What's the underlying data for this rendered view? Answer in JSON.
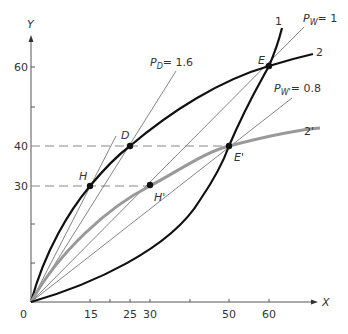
{
  "diagram": {
    "axes": {
      "x_label": "X",
      "y_label": "Y",
      "origin_label": "0",
      "x_ticks": [
        {
          "value": 15,
          "label": "15"
        },
        {
          "value": 20,
          "label": ""
        },
        {
          "value": 25,
          "label": "25"
        },
        {
          "value": 30,
          "label": "30"
        },
        {
          "value": 40,
          "label": ""
        },
        {
          "value": 50,
          "label": "50"
        },
        {
          "value": 60,
          "label": "60"
        }
      ],
      "y_ticks": [
        {
          "value": 10,
          "label": ""
        },
        {
          "value": 20,
          "label": ""
        },
        {
          "value": 30,
          "label": "30"
        },
        {
          "value": 40,
          "label": "40"
        },
        {
          "value": 50,
          "label": ""
        },
        {
          "value": 60,
          "label": "60"
        }
      ]
    },
    "curves": [
      {
        "id": "1",
        "label": "1",
        "color": "#111111",
        "shape": "convex",
        "passes_through": [
          "E'",
          "E"
        ]
      },
      {
        "id": "2",
        "label": "2",
        "color": "#111111",
        "shape": "concave",
        "passes_through": [
          "H",
          "D",
          "E"
        ]
      },
      {
        "id": "2prime",
        "label": "2'",
        "color": "#999999",
        "shape": "concave",
        "passes_through": [
          "H'",
          "E'"
        ]
      }
    ],
    "price_lines": [
      {
        "id": "pd",
        "label_main": "P",
        "label_sub": "D",
        "label_value": "= 1.6",
        "slope": 1.6
      },
      {
        "id": "pw",
        "label_main": "P",
        "label_sub": "W",
        "label_value": "= 1",
        "slope": 1
      },
      {
        "id": "pw2",
        "label_main": "P",
        "label_sub": "W'",
        "label_value": "= 0.8",
        "slope": 0.8
      }
    ],
    "points": [
      {
        "id": "D",
        "label": "D",
        "x": 25,
        "y": 40
      },
      {
        "id": "E",
        "label": "E",
        "x": 60,
        "y": 60
      },
      {
        "id": "E_prime",
        "label": "E'",
        "x": 50,
        "y": 40
      },
      {
        "id": "H",
        "label": "H",
        "x": 15,
        "y": 30
      },
      {
        "id": "H_prime",
        "label": "H'",
        "x": 30,
        "y": 30
      }
    ],
    "dashed_guides": [
      {
        "y": 40,
        "from_x": 0,
        "to_x": 50
      },
      {
        "y": 30,
        "from_x": 0,
        "to_x": 30
      }
    ]
  }
}
